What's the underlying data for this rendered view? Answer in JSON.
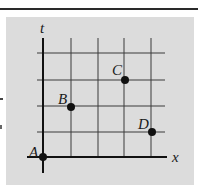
{
  "diagram": {
    "type": "spacetime-grid",
    "axes": {
      "vertical_label": "t",
      "horizontal_label": "x"
    },
    "grid": {
      "columns": 4,
      "rows": 4
    },
    "points": [
      {
        "label": "A",
        "grid_x": 0,
        "grid_t": 0
      },
      {
        "label": "B",
        "grid_x": 1,
        "grid_t": 2
      },
      {
        "label": "C",
        "grid_x": 3,
        "grid_t": 3
      },
      {
        "label": "D",
        "grid_x": 4,
        "grid_t": 1
      }
    ],
    "colors": {
      "panel": "#dcdcdc",
      "lines": "#2a2a2a"
    }
  }
}
